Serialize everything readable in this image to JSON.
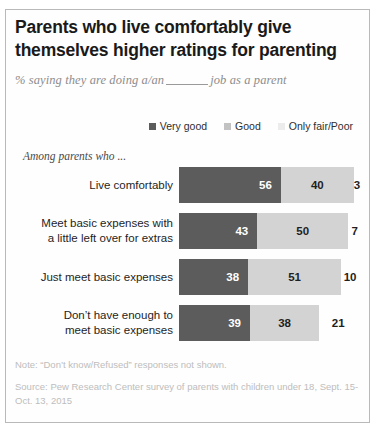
{
  "title": {
    "line1": "Parents who live comfortably give",
    "line2": "themselves higher ratings for parenting"
  },
  "subtitle": {
    "before": "% saying they are doing a/an",
    "after": "job as a parent"
  },
  "group_label": "Among parents who ...",
  "footer": {
    "note": "Note: “Don’t know/Refused” responses not shown.",
    "source": "Source: Pew Research Center survey of parents with children under 18, Sept. 15-Oct. 13, 2015"
  },
  "colors": {
    "very_good": "#5c5c5c",
    "good": "#d3d3d3",
    "only_fair_poor": "#ececec",
    "text": "#1f1f1f",
    "muted": "#bdbdbd"
  },
  "chart_data": {
    "type": "bar",
    "orientation": "horizontal",
    "stacked": true,
    "title": "Parents who live comfortably give themselves higher ratings for parenting",
    "subtitle": "% saying they are doing a/an ____ job as a parent",
    "xlabel": "",
    "ylabel": "",
    "grid": false,
    "legend_position": "top-right",
    "categories": [
      "Live comfortably",
      "Meet basic expenses with a little left over for extras",
      "Just meet basic expenses",
      "Don’t have enough to meet basic expenses"
    ],
    "series": [
      {
        "name": "Very good",
        "color": "#5c5c5c",
        "values": [
          56,
          43,
          38,
          39
        ]
      },
      {
        "name": "Good",
        "color": "#d3d3d3",
        "values": [
          40,
          50,
          51,
          38
        ]
      },
      {
        "name": "Only fair/Poor",
        "color": "#ececec",
        "values": [
          3,
          7,
          10,
          21
        ]
      }
    ],
    "note": "Note: “Don’t know/Refused” responses not shown.",
    "source": "Source: Pew Research Center survey of parents with children under 18, Sept. 15-Oct. 13, 2015"
  },
  "rows": [
    {
      "label_line1": "Live comfortably",
      "label_line2": "",
      "very_good": 56,
      "good": 40,
      "only_fair_poor": 3
    },
    {
      "label_line1": "Meet basic expenses with",
      "label_line2": "a little left over for extras",
      "very_good": 43,
      "good": 50,
      "only_fair_poor": 7
    },
    {
      "label_line1": "Just meet basic expenses",
      "label_line2": "",
      "very_good": 38,
      "good": 51,
      "only_fair_poor": 10
    },
    {
      "label_line1": "Don’t have enough to",
      "label_line2": "meet basic expenses",
      "very_good": 39,
      "good": 38,
      "only_fair_poor": 21
    }
  ]
}
